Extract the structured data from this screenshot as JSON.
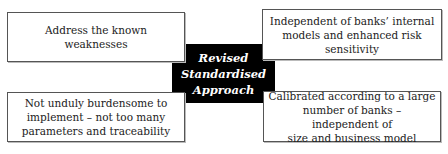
{
  "diagram": {
    "center": {
      "lines": [
        "Revised",
        "Standardised",
        "Approach"
      ]
    },
    "boxes": {
      "top_left": {
        "lines": [
          "Address the known weaknesses"
        ]
      },
      "top_right": {
        "lines": [
          "Independent of banks’ internal",
          "models and enhanced risk",
          "sensitivity"
        ]
      },
      "bottom_left": {
        "lines": [
          "Not unduly burdensome to",
          "implement – not too many",
          "parameters and traceability"
        ]
      },
      "bottom_right": {
        "lines": [
          "Calibrated according to a large",
          "number of banks – independent of",
          "size and business model"
        ]
      }
    },
    "colors": {
      "center_bg": "#000000",
      "center_text": "#ffffff",
      "box_border": "#555555"
    }
  }
}
